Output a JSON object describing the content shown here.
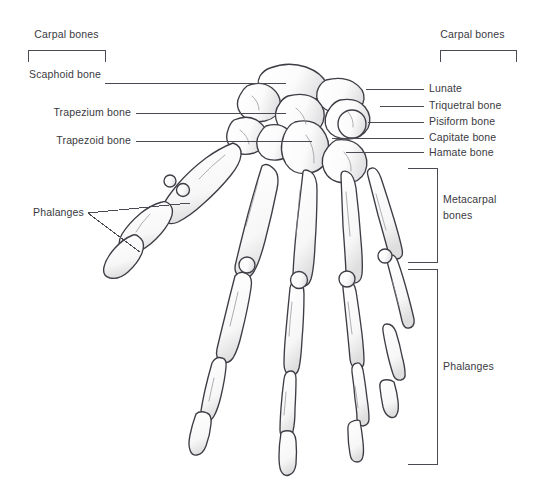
{
  "diagram": {
    "background_color": "#ffffff",
    "ink_color": "#3a3a42",
    "line_color": "#4a4a52"
  },
  "labels_left": {
    "carpal_bracket": "Carpal bones",
    "scaphoid": "Scaphoid bone",
    "trapezium": "Trapezium bone",
    "trapezoid": "Trapezoid bone",
    "phalanges": "Phalanges"
  },
  "labels_right": {
    "carpal_bracket": "Carpal bones",
    "lunate": "Lunate",
    "triquetral": "Triquetral bone",
    "pisiform": "Pisiform bone",
    "capitate": "Capitate bone",
    "hamate": "Hamate bone",
    "metacarpal_line1": "Metacarpal",
    "metacarpal_line2": "bones",
    "phalanges": "Phalanges"
  }
}
